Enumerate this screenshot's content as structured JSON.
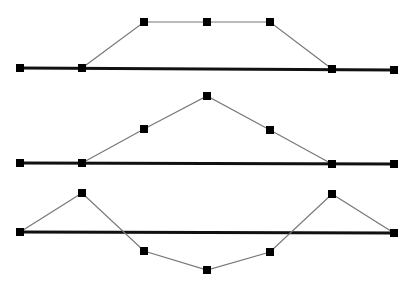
{
  "canvas": {
    "width": 414,
    "height": 288,
    "background": "#ffffff"
  },
  "style": {
    "baseline_color": "#111111",
    "baseline_width": 3,
    "path_color": "#777777",
    "path_width": 1.2,
    "node_color": "#000000",
    "node_size": 8
  },
  "diagrams": [
    {
      "name": "trapezoid-bump",
      "baseline": {
        "y": 68,
        "x1": 20,
        "x2": 394
      },
      "baseline_nodes": [
        [
          20,
          68
        ],
        [
          82,
          68
        ],
        [
          332,
          69
        ],
        [
          394,
          70
        ]
      ],
      "path": [
        [
          82,
          68
        ],
        [
          144,
          22
        ],
        [
          207,
          22
        ],
        [
          270,
          22
        ],
        [
          332,
          69
        ]
      ]
    },
    {
      "name": "triangle-peak",
      "baseline": {
        "y": 163,
        "x1": 20,
        "x2": 394
      },
      "baseline_nodes": [
        [
          20,
          163
        ],
        [
          82,
          163
        ],
        [
          332,
          164
        ],
        [
          394,
          164
        ]
      ],
      "path": [
        [
          82,
          163
        ],
        [
          144,
          129
        ],
        [
          207,
          96
        ],
        [
          270,
          130
        ],
        [
          332,
          164
        ]
      ]
    },
    {
      "name": "wave",
      "baseline": {
        "y": 232,
        "x1": 20,
        "x2": 394
      },
      "baseline_nodes": [
        [
          20,
          232
        ],
        [
          394,
          233
        ]
      ],
      "path": [
        [
          20,
          232
        ],
        [
          82,
          193
        ],
        [
          144,
          251
        ],
        [
          207,
          270
        ],
        [
          270,
          252
        ],
        [
          332,
          194
        ],
        [
          394,
          233
        ]
      ]
    }
  ]
}
